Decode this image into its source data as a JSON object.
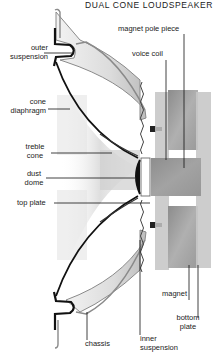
{
  "title": "DUAL CONE LOUDSPEAKER",
  "labels": {
    "outer_suspension": [
      "outer",
      "suspension"
    ],
    "cone_diaphragm": [
      "cone",
      "diaphragm"
    ],
    "treble_cone": [
      "treble",
      "cone"
    ],
    "dust_dome": [
      "dust",
      "dome"
    ],
    "top_plate": "top plate",
    "magnet_pole_piece": "magnet pole piece",
    "voice_coil": "voice coil",
    "magnet": "magnet",
    "bottom_plate": [
      "bottom",
      "plate"
    ],
    "chassis": "chassis",
    "inner_suspension": [
      "inner",
      "suspension"
    ]
  },
  "colors": {
    "line": "#1a1a1a",
    "chassis_fill": "#d8d8d8",
    "chassis_edge": "#8a8a8a",
    "magnet_fill": "#9a9a9a",
    "plate_fill": "#b5b5b5",
    "shadow": "#cfcfcf"
  }
}
